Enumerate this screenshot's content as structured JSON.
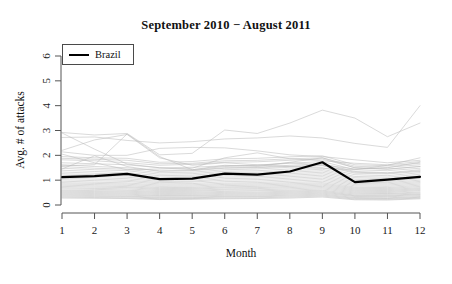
{
  "chart_data": {
    "type": "line",
    "title": "September 2010 − August 2011",
    "xlabel": "Month",
    "ylabel": "Avg. # of attacks",
    "x": [
      1,
      2,
      3,
      4,
      5,
      6,
      7,
      8,
      9,
      10,
      11,
      12
    ],
    "xticklabels": [
      "1",
      "2",
      "3",
      "4",
      "5",
      "6",
      "7",
      "8",
      "9",
      "10",
      "11",
      "12"
    ],
    "yticks": [
      0,
      1,
      2,
      3,
      4,
      5,
      6
    ],
    "yticklabels": [
      "0",
      "1",
      "2",
      "3",
      "4",
      "5",
      "6"
    ],
    "xlim": [
      1,
      12
    ],
    "ylim": [
      0,
      6
    ],
    "grid": false,
    "legend": {
      "position": "top-left",
      "entries": [
        {
          "label": "Brazil",
          "color": "#000000",
          "linewidth": 2.2
        }
      ]
    },
    "highlight_color": "#000000",
    "background_series_color": "#b9b9b9",
    "series": [
      {
        "name": "Brazil",
        "highlight": true,
        "color": "#000000",
        "values": [
          1.12,
          1.16,
          1.25,
          1.04,
          1.06,
          1.26,
          1.22,
          1.35,
          1.72,
          0.92,
          1.02,
          1.13
        ]
      },
      {
        "name": "country-01",
        "highlight": false,
        "values": [
          2.92,
          2.82,
          2.88,
          2.02,
          2.08,
          3.02,
          2.88,
          3.3,
          3.82,
          3.5,
          2.75,
          3.3
        ]
      },
      {
        "name": "country-02",
        "highlight": false,
        "values": [
          2.72,
          2.74,
          2.6,
          2.5,
          2.55,
          2.66,
          2.7,
          2.78,
          2.7,
          2.48,
          2.32,
          4.0
        ]
      },
      {
        "name": "country-03",
        "highlight": false,
        "values": [
          2.2,
          2.62,
          2.84,
          1.9,
          1.6,
          1.7,
          1.62,
          1.55,
          1.48,
          1.42,
          1.6,
          1.9
        ]
      },
      {
        "name": "country-04",
        "highlight": false,
        "values": [
          2.14,
          2.0,
          2.0,
          2.28,
          2.32,
          2.3,
          2.18,
          2.02,
          1.95,
          1.82,
          1.7,
          1.8
        ]
      },
      {
        "name": "country-05",
        "highlight": false,
        "values": [
          2.9,
          2.25,
          1.65,
          1.5,
          1.42,
          1.55,
          1.6,
          1.7,
          1.62,
          1.45,
          1.5,
          1.72
        ]
      },
      {
        "name": "country-06",
        "highlight": false,
        "values": [
          1.82,
          1.78,
          1.7,
          1.6,
          1.64,
          1.72,
          1.74,
          1.8,
          1.85,
          1.5,
          1.45,
          1.55
        ]
      },
      {
        "name": "country-07",
        "highlight": false,
        "values": [
          1.7,
          1.66,
          1.62,
          1.5,
          1.52,
          1.58,
          1.6,
          1.68,
          1.75,
          1.42,
          1.38,
          1.48
        ]
      },
      {
        "name": "country-08",
        "highlight": false,
        "values": [
          1.62,
          1.55,
          1.5,
          1.38,
          1.4,
          1.5,
          1.52,
          1.6,
          1.66,
          1.35,
          1.3,
          1.42
        ]
      },
      {
        "name": "country-09",
        "highlight": false,
        "values": [
          1.55,
          1.48,
          1.44,
          1.3,
          1.32,
          1.42,
          1.45,
          1.52,
          1.58,
          1.28,
          1.25,
          1.35
        ]
      },
      {
        "name": "country-10",
        "highlight": false,
        "values": [
          1.48,
          1.42,
          1.38,
          1.24,
          1.26,
          1.36,
          1.38,
          1.45,
          1.5,
          1.22,
          1.18,
          1.3
        ]
      },
      {
        "name": "country-11",
        "highlight": false,
        "values": [
          1.4,
          1.35,
          1.3,
          1.18,
          1.2,
          1.3,
          1.32,
          1.38,
          1.44,
          1.15,
          1.12,
          1.24
        ]
      },
      {
        "name": "country-12",
        "highlight": false,
        "values": [
          1.33,
          1.28,
          1.24,
          1.12,
          1.14,
          1.24,
          1.26,
          1.32,
          1.38,
          1.1,
          1.06,
          1.18
        ]
      },
      {
        "name": "country-13",
        "highlight": false,
        "values": [
          1.26,
          1.22,
          1.18,
          1.06,
          1.08,
          1.18,
          1.2,
          1.26,
          1.32,
          1.04,
          1.0,
          1.12
        ]
      },
      {
        "name": "country-14",
        "highlight": false,
        "values": [
          1.2,
          1.16,
          1.12,
          1.0,
          1.02,
          1.12,
          1.14,
          1.2,
          1.26,
          0.98,
          0.95,
          1.06
        ]
      },
      {
        "name": "country-15",
        "highlight": false,
        "values": [
          1.14,
          1.1,
          1.06,
          0.95,
          0.96,
          1.06,
          1.08,
          1.14,
          1.2,
          0.92,
          0.9,
          1.0
        ]
      },
      {
        "name": "country-16",
        "highlight": false,
        "values": [
          1.08,
          1.04,
          1.0,
          0.9,
          0.92,
          1.0,
          1.02,
          1.08,
          1.14,
          0.87,
          0.85,
          0.95
        ]
      },
      {
        "name": "country-17",
        "highlight": false,
        "values": [
          1.02,
          0.98,
          0.95,
          0.85,
          0.86,
          0.94,
          0.96,
          1.02,
          1.08,
          0.82,
          0.8,
          0.9
        ]
      },
      {
        "name": "country-18",
        "highlight": false,
        "values": [
          0.96,
          0.92,
          0.89,
          0.8,
          0.81,
          0.88,
          0.9,
          0.96,
          1.02,
          0.77,
          0.75,
          0.85
        ]
      },
      {
        "name": "country-19",
        "highlight": false,
        "values": [
          0.9,
          0.87,
          0.84,
          0.75,
          0.76,
          0.83,
          0.85,
          0.9,
          0.96,
          0.72,
          0.7,
          0.8
        ]
      },
      {
        "name": "country-20",
        "highlight": false,
        "values": [
          0.85,
          0.82,
          0.79,
          0.7,
          0.71,
          0.78,
          0.8,
          0.85,
          0.9,
          0.68,
          0.66,
          0.75
        ]
      },
      {
        "name": "country-21",
        "highlight": false,
        "values": [
          0.8,
          0.77,
          0.74,
          0.66,
          0.67,
          0.73,
          0.75,
          0.8,
          0.85,
          0.64,
          0.62,
          0.7
        ]
      },
      {
        "name": "country-22",
        "highlight": false,
        "values": [
          0.75,
          0.72,
          0.7,
          0.62,
          0.63,
          0.69,
          0.7,
          0.75,
          0.8,
          0.6,
          0.58,
          0.66
        ]
      },
      {
        "name": "country-23",
        "highlight": false,
        "values": [
          0.7,
          0.67,
          0.65,
          0.58,
          0.59,
          0.64,
          0.66,
          0.7,
          0.75,
          0.56,
          0.54,
          0.62
        ]
      },
      {
        "name": "country-24",
        "highlight": false,
        "values": [
          0.65,
          0.63,
          0.6,
          0.54,
          0.55,
          0.6,
          0.61,
          0.65,
          0.7,
          0.52,
          0.5,
          0.58
        ]
      },
      {
        "name": "country-25",
        "highlight": false,
        "values": [
          0.6,
          0.58,
          0.56,
          0.5,
          0.51,
          0.55,
          0.57,
          0.6,
          0.65,
          0.48,
          0.46,
          0.53
        ]
      },
      {
        "name": "country-26",
        "highlight": false,
        "values": [
          0.56,
          0.54,
          0.52,
          0.46,
          0.47,
          0.51,
          0.52,
          0.56,
          0.6,
          0.44,
          0.43,
          0.49
        ]
      },
      {
        "name": "country-27",
        "highlight": false,
        "values": [
          0.52,
          0.5,
          0.48,
          0.42,
          0.43,
          0.47,
          0.48,
          0.52,
          0.56,
          0.4,
          0.39,
          0.45
        ]
      },
      {
        "name": "country-28",
        "highlight": false,
        "values": [
          0.48,
          0.46,
          0.44,
          0.38,
          0.39,
          0.43,
          0.44,
          0.48,
          0.52,
          0.37,
          0.36,
          0.42
        ]
      },
      {
        "name": "country-29",
        "highlight": false,
        "values": [
          0.44,
          0.42,
          0.4,
          0.35,
          0.36,
          0.39,
          0.4,
          0.44,
          0.48,
          0.34,
          0.33,
          0.38
        ]
      },
      {
        "name": "country-30",
        "highlight": false,
        "values": [
          0.4,
          0.38,
          0.36,
          0.31,
          0.32,
          0.35,
          0.36,
          0.4,
          0.44,
          0.3,
          0.29,
          0.34
        ]
      },
      {
        "name": "country-31",
        "highlight": false,
        "values": [
          0.36,
          0.34,
          0.33,
          0.28,
          0.29,
          0.32,
          0.33,
          0.36,
          0.4,
          0.27,
          0.26,
          0.31
        ]
      },
      {
        "name": "country-32",
        "highlight": false,
        "values": [
          0.32,
          0.3,
          0.29,
          0.25,
          0.26,
          0.28,
          0.29,
          0.32,
          0.36,
          0.24,
          0.23,
          0.28
        ]
      },
      {
        "name": "country-33",
        "highlight": false,
        "values": [
          0.28,
          0.27,
          0.26,
          0.22,
          0.23,
          0.25,
          0.26,
          0.28,
          0.32,
          0.21,
          0.2,
          0.25
        ]
      },
      {
        "name": "country-34",
        "highlight": false,
        "values": [
          1.95,
          1.9,
          1.88,
          1.72,
          1.75,
          1.86,
          1.88,
          1.94,
          1.98,
          1.62,
          1.58,
          1.68
        ]
      },
      {
        "name": "country-35",
        "highlight": false,
        "values": [
          1.88,
          1.84,
          1.8,
          1.66,
          1.68,
          1.78,
          1.8,
          1.86,
          1.9,
          1.56,
          1.52,
          1.62
        ]
      },
      {
        "name": "country-36",
        "highlight": false,
        "values": [
          1.45,
          1.98,
          1.55,
          1.35,
          1.38,
          1.48,
          1.5,
          1.56,
          1.6,
          1.32,
          1.28,
          1.38
        ]
      },
      {
        "name": "country-37",
        "highlight": false,
        "values": [
          2.05,
          1.7,
          1.42,
          1.45,
          1.48,
          1.9,
          2.1,
          1.86,
          1.78,
          1.68,
          1.62,
          1.75
        ]
      },
      {
        "name": "country-38",
        "highlight": false,
        "values": [
          1.58,
          1.62,
          2.86,
          1.95,
          1.42,
          1.6,
          1.55,
          1.72,
          1.9,
          1.5,
          1.44,
          1.55
        ]
      }
    ]
  }
}
